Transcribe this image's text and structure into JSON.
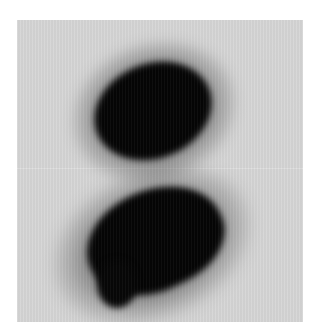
{
  "image": {
    "description": "Grayscale scan with two dark blobs on a light gray background",
    "background_color": "#d6d6d6",
    "blob_color": "#050505",
    "blobs": [
      {
        "name": "upper-blob",
        "shape": "ellipse"
      },
      {
        "name": "lower-blob",
        "shape": "irregular-with-tail"
      }
    ]
  }
}
